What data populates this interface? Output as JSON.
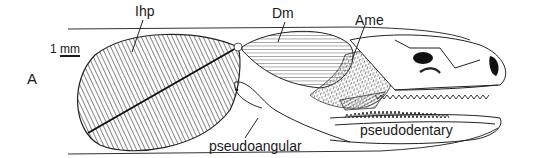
{
  "figure": {
    "panel_label": "A",
    "scale_bar": {
      "number": "1",
      "unit": "mm"
    },
    "labels": {
      "ihp": "Ihp",
      "dm": "Dm",
      "ame": "Ame",
      "pseudoangular": "pseudoangular",
      "pseudodentary": "pseudodentary"
    },
    "colors": {
      "ink": "#1a1a1a",
      "background": "#ffffff",
      "fill_dark": "#111111"
    }
  }
}
